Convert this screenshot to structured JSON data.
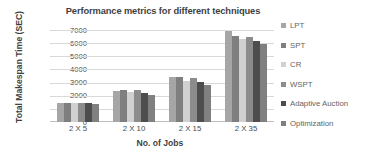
{
  "chart_data": {
    "type": "bar",
    "title": "Performance metrics for different techniques",
    "xlabel": "No. of Jobs",
    "ylabel": "Total Makespan Time (SEC)",
    "categories": [
      "2 X 5",
      "2 X 10",
      "2 X 15",
      "2 X 35"
    ],
    "ylim": [
      0,
      7000
    ],
    "yticks": [
      7000,
      6000,
      5000,
      4000,
      3000,
      2000,
      1000,
      0
    ],
    "ytick_labels": [
      "7000",
      "6000",
      "5000",
      "4000",
      "3000",
      "2000",
      "1000",
      "0"
    ],
    "grid": true,
    "legend_position": "right",
    "series": [
      {
        "name": "LPT",
        "color": "#a6a6a6",
        "values": [
          1450,
          2350,
          3450,
          6900
        ]
      },
      {
        "name": "SPT",
        "color": "#7f7f7f",
        "values": [
          1430,
          2400,
          3400,
          6550
        ]
      },
      {
        "name": "CR",
        "color": "#d0d0d0",
        "values": [
          1420,
          2250,
          3150,
          6300
        ]
      },
      {
        "name": "WSPT",
        "color": "#8c8c8c",
        "values": [
          1440,
          2420,
          3350,
          6500
        ]
      },
      {
        "name": "Adaptive Auction",
        "color": "#4d4d4d",
        "values": [
          1430,
          2180,
          3050,
          6150
        ]
      },
      {
        "name": "Optimization",
        "color": "#808080",
        "values": [
          1390,
          2080,
          2800,
          5900
        ]
      }
    ]
  }
}
